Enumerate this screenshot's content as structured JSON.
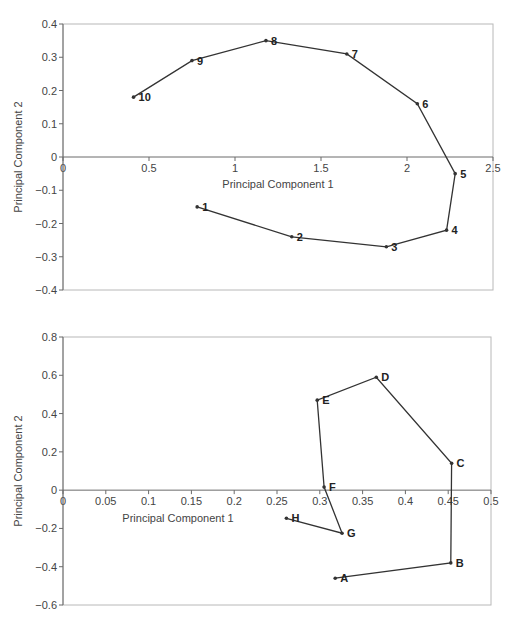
{
  "chart_data": [
    {
      "type": "line",
      "title": "",
      "xlabel": "Principal Component 1",
      "ylabel": "Principal Component 2",
      "xlim": [
        0,
        2.5
      ],
      "ylim": [
        -0.4,
        0.4
      ],
      "xticks": [
        "0",
        "0.5",
        "1",
        "1.5",
        "2",
        "2.5"
      ],
      "xtick_values": [
        0,
        0.5,
        1,
        1.5,
        2,
        2.5
      ],
      "yticks": [
        "0.4",
        "0.3",
        "0.2",
        "0.1",
        "0",
        "-0.1",
        "-0.2",
        "-0.3",
        "-0.4"
      ],
      "ytick_values": [
        0.4,
        0.3,
        0.2,
        0.1,
        0,
        -0.1,
        -0.2,
        -0.3,
        -0.4
      ],
      "grid": false,
      "legend": "none",
      "series": [
        {
          "name": "trajectory",
          "points": [
            {
              "label": "1",
              "x": 0.78,
              "y": -0.15
            },
            {
              "label": "2",
              "x": 1.33,
              "y": -0.24
            },
            {
              "label": "3",
              "x": 1.88,
              "y": -0.27
            },
            {
              "label": "4",
              "x": 2.23,
              "y": -0.22
            },
            {
              "label": "5",
              "x": 2.28,
              "y": -0.05
            },
            {
              "label": "6",
              "x": 2.06,
              "y": 0.16
            },
            {
              "label": "7",
              "x": 1.65,
              "y": 0.31
            },
            {
              "label": "8",
              "x": 1.18,
              "y": 0.35
            },
            {
              "label": "9",
              "x": 0.75,
              "y": 0.29
            },
            {
              "label": "10",
              "x": 0.41,
              "y": 0.18
            }
          ]
        }
      ]
    },
    {
      "type": "line",
      "title": "",
      "xlabel": "Principal Component 1",
      "ylabel": "Principal Component 2",
      "xlim": [
        0,
        0.5
      ],
      "ylim": [
        -0.6,
        0.8
      ],
      "xticks": [
        "0",
        "0.05",
        "0.1",
        "0.15",
        "0.2",
        "0.25",
        "0.3",
        "0.35",
        "0.4",
        "0.45",
        "0.5"
      ],
      "xtick_values": [
        0,
        0.05,
        0.1,
        0.15,
        0.2,
        0.25,
        0.3,
        0.35,
        0.4,
        0.45,
        0.5
      ],
      "yticks": [
        "0.8",
        "0.6",
        "0.4",
        "0.2",
        "0",
        "-0.2",
        "-0.4",
        "-0.6"
      ],
      "ytick_values": [
        0.8,
        0.6,
        0.4,
        0.2,
        0,
        -0.2,
        -0.4,
        -0.6
      ],
      "grid": false,
      "legend": "none",
      "series": [
        {
          "name": "trajectory",
          "points": [
            {
              "label": "A",
              "x": 0.318,
              "y": -0.46
            },
            {
              "label": "B",
              "x": 0.453,
              "y": -0.38
            },
            {
              "label": "C",
              "x": 0.454,
              "y": 0.14
            },
            {
              "label": "D",
              "x": 0.366,
              "y": 0.59
            },
            {
              "label": "E",
              "x": 0.297,
              "y": 0.47
            },
            {
              "label": "F",
              "x": 0.305,
              "y": 0.016
            },
            {
              "label": "G",
              "x": 0.326,
              "y": -0.225
            },
            {
              "label": "H",
              "x": 0.261,
              "y": -0.147
            }
          ]
        }
      ]
    }
  ]
}
